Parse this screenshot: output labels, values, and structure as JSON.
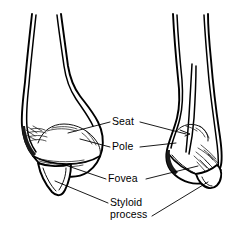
{
  "figure": {
    "name": "distal-radius-ulna-anatomy",
    "background_color": "#ffffff",
    "line_color": "#000000",
    "view_count": 2
  },
  "labels": [
    {
      "id": "seat",
      "text": "Seat",
      "description": "Sigmoid notch / seat of the distal radius",
      "has_leader_left": true,
      "has_leader_right": true
    },
    {
      "id": "pole",
      "text": "Pole",
      "description": "Pole of the distal articular surface",
      "has_leader_left": true,
      "has_leader_right": true
    },
    {
      "id": "fovea",
      "text": "Fovea",
      "description": "Fovea at the base of the styloid",
      "has_leader_left": true,
      "has_leader_right": true
    },
    {
      "id": "styloid-process",
      "text": "Styloid\nprocess",
      "line1": "Styloid",
      "line2": "process",
      "description": "Styloid process projecting distally",
      "has_leader_left": true,
      "has_leader_right": true
    }
  ],
  "views": [
    {
      "id": "left-view",
      "name": "anterior-view",
      "position": "left"
    },
    {
      "id": "right-view",
      "name": "lateral-view",
      "position": "right"
    }
  ],
  "colors": {
    "stroke": "#000000",
    "fill": "#ffffff",
    "detail": "#1a1a1a"
  }
}
